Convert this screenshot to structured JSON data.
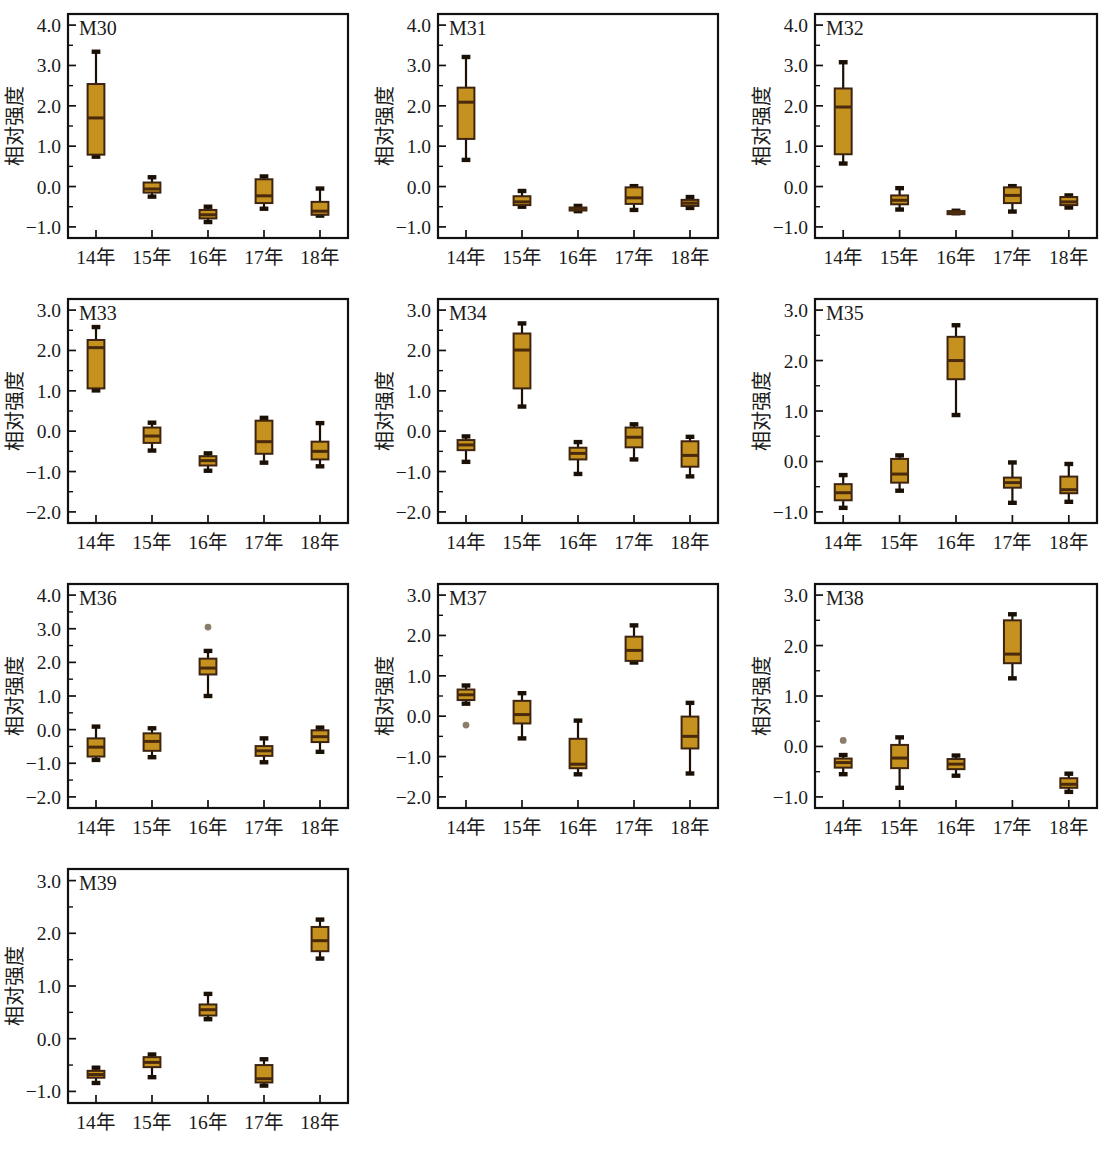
{
  "figure": {
    "kind": "box-plot-panel-grid",
    "panel_count": 10,
    "y_axis_title": "相对强度",
    "category_labels": [
      "14年",
      "15年",
      "16年",
      "17年",
      "18年"
    ],
    "colors": {
      "box_fill": "#C6921F",
      "box_edge": "#3D2410",
      "median_line": "#4A2A0C",
      "whisker": "#1B1005",
      "outlier": "#8A7E6A",
      "frame": "#111111",
      "background": "#FFFFFF",
      "text": "#1A1A1A"
    }
  },
  "chart_data": [
    {
      "type": "box",
      "title": "M30",
      "xlabel": "",
      "ylabel": "相对强度",
      "ylim": [
        -1.0,
        4.0
      ],
      "yticks": [
        -1.0,
        0.0,
        1.0,
        2.0,
        3.0,
        4.0
      ],
      "ytick_labels": [
        "-1.0",
        "0.0",
        "1.0",
        "2.0",
        "3.0",
        "4.0"
      ],
      "grid": false,
      "categories": [
        "14年",
        "15年",
        "16年",
        "17年",
        "18年"
      ],
      "boxes": [
        {
          "category": "14年",
          "min": 0.74,
          "q1": 0.79,
          "median": 1.7,
          "q3": 2.54,
          "max": 3.34,
          "outliers": []
        },
        {
          "category": "15年",
          "min": -0.25,
          "q1": -0.15,
          "median": -0.06,
          "q3": 0.1,
          "max": 0.23,
          "outliers": []
        },
        {
          "category": "16年",
          "min": -0.88,
          "q1": -0.79,
          "median": -0.7,
          "q3": -0.58,
          "max": -0.5,
          "outliers": []
        },
        {
          "category": "17年",
          "min": -0.55,
          "q1": -0.41,
          "median": -0.23,
          "q3": 0.18,
          "max": 0.25,
          "outliers": []
        },
        {
          "category": "18年",
          "min": -0.72,
          "q1": -0.7,
          "median": -0.61,
          "q3": -0.38,
          "max": -0.05,
          "outliers": []
        }
      ]
    },
    {
      "type": "box",
      "title": "M31",
      "xlabel": "",
      "ylabel": "相对强度",
      "ylim": [
        -1.0,
        4.0
      ],
      "yticks": [
        -1.0,
        0.0,
        1.0,
        2.0,
        3.0,
        4.0
      ],
      "ytick_labels": [
        "-1.0",
        "0.0",
        "1.0",
        "2.0",
        "3.0",
        "4.0"
      ],
      "grid": false,
      "categories": [
        "14年",
        "15年",
        "16年",
        "17年",
        "18年"
      ],
      "boxes": [
        {
          "category": "14年",
          "min": 0.66,
          "q1": 1.18,
          "median": 2.09,
          "q3": 2.45,
          "max": 3.21,
          "outliers": []
        },
        {
          "category": "15年",
          "min": -0.5,
          "q1": -0.46,
          "median": -0.38,
          "q3": -0.24,
          "max": -0.11,
          "outliers": []
        },
        {
          "category": "16年",
          "min": -0.61,
          "q1": -0.59,
          "median": -0.56,
          "q3": -0.52,
          "max": -0.48,
          "outliers": []
        },
        {
          "category": "17年",
          "min": -0.58,
          "q1": -0.43,
          "median": -0.28,
          "q3": -0.02,
          "max": 0.01,
          "outliers": []
        },
        {
          "category": "18年",
          "min": -0.53,
          "q1": -0.48,
          "median": -0.41,
          "q3": -0.33,
          "max": -0.26,
          "outliers": []
        }
      ]
    },
    {
      "type": "box",
      "title": "M32",
      "xlabel": "",
      "ylabel": "相对强度",
      "ylim": [
        -1.0,
        4.0
      ],
      "yticks": [
        -1.0,
        0.0,
        1.0,
        2.0,
        3.0,
        4.0
      ],
      "ytick_labels": [
        "-1.0",
        "0.0",
        "1.0",
        "2.0",
        "3.0",
        "4.0"
      ],
      "grid": false,
      "categories": [
        "14年",
        "15年",
        "16年",
        "17年",
        "18年"
      ],
      "boxes": [
        {
          "category": "14年",
          "min": 0.57,
          "q1": 0.8,
          "median": 1.97,
          "q3": 2.43,
          "max": 3.08,
          "outliers": []
        },
        {
          "category": "15年",
          "min": -0.57,
          "q1": -0.44,
          "median": -0.34,
          "q3": -0.22,
          "max": -0.04,
          "outliers": []
        },
        {
          "category": "16年",
          "min": -0.66,
          "q1": -0.65,
          "median": -0.63,
          "q3": -0.61,
          "max": -0.6,
          "outliers": []
        },
        {
          "category": "17年",
          "min": -0.62,
          "q1": -0.41,
          "median": -0.22,
          "q3": -0.02,
          "max": 0.01,
          "outliers": []
        },
        {
          "category": "18年",
          "min": -0.52,
          "q1": -0.46,
          "median": -0.38,
          "q3": -0.26,
          "max": -0.22,
          "outliers": []
        }
      ]
    },
    {
      "type": "box",
      "title": "M33",
      "xlabel": "",
      "ylabel": "相对强度",
      "ylim": [
        -2.0,
        3.0
      ],
      "yticks": [
        -2.0,
        -1.0,
        0.0,
        1.0,
        2.0,
        3.0
      ],
      "ytick_labels": [
        "-2.0",
        "-1.0",
        "0.0",
        "1.0",
        "2.0",
        "3.0"
      ],
      "grid": false,
      "categories": [
        "14年",
        "15年",
        "16年",
        "17年",
        "18年"
      ],
      "boxes": [
        {
          "category": "14年",
          "min": 1.01,
          "q1": 1.06,
          "median": 2.07,
          "q3": 2.26,
          "max": 2.58,
          "outliers": []
        },
        {
          "category": "15年",
          "min": -0.48,
          "q1": -0.29,
          "median": -0.12,
          "q3": 0.09,
          "max": 0.21,
          "outliers": []
        },
        {
          "category": "16年",
          "min": -0.98,
          "q1": -0.85,
          "median": -0.73,
          "q3": -0.62,
          "max": -0.55,
          "outliers": []
        },
        {
          "category": "17年",
          "min": -0.78,
          "q1": -0.56,
          "median": -0.26,
          "q3": 0.26,
          "max": 0.33,
          "outliers": []
        },
        {
          "category": "18年",
          "min": -0.87,
          "q1": -0.7,
          "median": -0.5,
          "q3": -0.26,
          "max": 0.2,
          "outliers": []
        }
      ]
    },
    {
      "type": "box",
      "title": "M34",
      "xlabel": "",
      "ylabel": "相对强度",
      "ylim": [
        -2.0,
        3.0
      ],
      "yticks": [
        -2.0,
        -1.0,
        0.0,
        1.0,
        2.0,
        3.0
      ],
      "ytick_labels": [
        "-2.0",
        "-1.0",
        "0.0",
        "1.0",
        "2.0",
        "3.0"
      ],
      "grid": false,
      "categories": [
        "14年",
        "15年",
        "16年",
        "17年",
        "18年"
      ],
      "boxes": [
        {
          "category": "14年",
          "min": -0.76,
          "q1": -0.47,
          "median": -0.34,
          "q3": -0.22,
          "max": -0.13,
          "outliers": []
        },
        {
          "category": "15年",
          "min": 0.61,
          "q1": 1.06,
          "median": 2.01,
          "q3": 2.42,
          "max": 2.67,
          "outliers": []
        },
        {
          "category": "16年",
          "min": -1.06,
          "q1": -0.7,
          "median": -0.55,
          "q3": -0.41,
          "max": -0.27,
          "outliers": []
        },
        {
          "category": "17年",
          "min": -0.7,
          "q1": -0.4,
          "median": -0.15,
          "q3": 0.09,
          "max": 0.17,
          "outliers": []
        },
        {
          "category": "18年",
          "min": -1.12,
          "q1": -0.88,
          "median": -0.6,
          "q3": -0.25,
          "max": -0.14,
          "outliers": []
        }
      ]
    },
    {
      "type": "box",
      "title": "M35",
      "xlabel": "",
      "ylabel": "相对强度",
      "ylim": [
        -1.0,
        3.0
      ],
      "yticks": [
        -1.0,
        0.0,
        1.0,
        2.0,
        3.0
      ],
      "ytick_labels": [
        "-1.0",
        "0.0",
        "1.0",
        "2.0",
        "3.0"
      ],
      "grid": false,
      "categories": [
        "14年",
        "15年",
        "16年",
        "17年",
        "18年"
      ],
      "boxes": [
        {
          "category": "14年",
          "min": -0.92,
          "q1": -0.77,
          "median": -0.62,
          "q3": -0.45,
          "max": -0.27,
          "outliers": []
        },
        {
          "category": "15年",
          "min": -0.58,
          "q1": -0.42,
          "median": -0.25,
          "q3": 0.05,
          "max": 0.12,
          "outliers": []
        },
        {
          "category": "16年",
          "min": 0.92,
          "q1": 1.63,
          "median": 2.0,
          "q3": 2.47,
          "max": 2.7,
          "outliers": []
        },
        {
          "category": "17年",
          "min": -0.82,
          "q1": -0.52,
          "median": -0.42,
          "q3": -0.32,
          "max": -0.02,
          "outliers": []
        },
        {
          "category": "18年",
          "min": -0.8,
          "q1": -0.63,
          "median": -0.56,
          "q3": -0.3,
          "max": -0.05,
          "outliers": []
        }
      ]
    },
    {
      "type": "box",
      "title": "M36",
      "xlabel": "",
      "ylabel": "相对强度",
      "ylim": [
        -2.0,
        4.0
      ],
      "yticks": [
        -2.0,
        -1.0,
        0.0,
        1.0,
        2.0,
        3.0,
        4.0
      ],
      "ytick_labels": [
        "-2.0",
        "-1.0",
        "0.0",
        "1.0",
        "2.0",
        "3.0",
        "4.0"
      ],
      "grid": false,
      "categories": [
        "14年",
        "15年",
        "16年",
        "17年",
        "18年"
      ],
      "boxes": [
        {
          "category": "14年",
          "min": -0.9,
          "q1": -0.8,
          "median": -0.52,
          "q3": -0.26,
          "max": 0.09,
          "outliers": []
        },
        {
          "category": "15年",
          "min": -0.82,
          "q1": -0.63,
          "median": -0.35,
          "q3": -0.11,
          "max": 0.04,
          "outliers": []
        },
        {
          "category": "16年",
          "min": 1.0,
          "q1": 1.64,
          "median": 1.83,
          "q3": 2.11,
          "max": 2.34,
          "outliers": [
            3.05
          ]
        },
        {
          "category": "17年",
          "min": -0.97,
          "q1": -0.78,
          "median": -0.63,
          "q3": -0.49,
          "max": -0.26,
          "outliers": []
        },
        {
          "category": "18年",
          "min": -0.66,
          "q1": -0.37,
          "median": -0.21,
          "q3": -0.02,
          "max": 0.06,
          "outliers": []
        }
      ]
    },
    {
      "type": "box",
      "title": "M37",
      "xlabel": "",
      "ylabel": "相对强度",
      "ylim": [
        -2.0,
        3.0
      ],
      "yticks": [
        -2.0,
        -1.0,
        0.0,
        1.0,
        2.0,
        3.0
      ],
      "ytick_labels": [
        "-2.0",
        "-1.0",
        "0.0",
        "1.0",
        "2.0",
        "3.0"
      ],
      "grid": false,
      "categories": [
        "14年",
        "15年",
        "16年",
        "17年",
        "18年"
      ],
      "boxes": [
        {
          "category": "14年",
          "min": 0.31,
          "q1": 0.4,
          "median": 0.53,
          "q3": 0.66,
          "max": 0.76,
          "outliers": [
            -0.22
          ]
        },
        {
          "category": "15年",
          "min": -0.55,
          "q1": -0.18,
          "median": 0.04,
          "q3": 0.38,
          "max": 0.57,
          "outliers": []
        },
        {
          "category": "16年",
          "min": -1.44,
          "q1": -1.29,
          "median": -1.19,
          "q3": -0.56,
          "max": -0.11,
          "outliers": []
        },
        {
          "category": "17年",
          "min": 1.33,
          "q1": 1.37,
          "median": 1.63,
          "q3": 1.97,
          "max": 2.25,
          "outliers": []
        },
        {
          "category": "18年",
          "min": -1.42,
          "q1": -0.8,
          "median": -0.5,
          "q3": -0.01,
          "max": 0.33,
          "outliers": []
        }
      ]
    },
    {
      "type": "box",
      "title": "M38",
      "xlabel": "",
      "ylabel": "相对强度",
      "ylim": [
        -1.0,
        3.0
      ],
      "yticks": [
        -1.0,
        0.0,
        1.0,
        2.0,
        3.0
      ],
      "ytick_labels": [
        "-1.0",
        "0.0",
        "1.0",
        "2.0",
        "3.0"
      ],
      "grid": false,
      "categories": [
        "14年",
        "15年",
        "16年",
        "17年",
        "18年"
      ],
      "boxes": [
        {
          "category": "14年",
          "min": -0.55,
          "q1": -0.42,
          "median": -0.32,
          "q3": -0.24,
          "max": -0.17,
          "outliers": [
            0.12
          ]
        },
        {
          "category": "15年",
          "min": -0.82,
          "q1": -0.43,
          "median": -0.23,
          "q3": 0.03,
          "max": 0.18,
          "outliers": []
        },
        {
          "category": "16年",
          "min": -0.58,
          "q1": -0.45,
          "median": -0.35,
          "q3": -0.25,
          "max": -0.18,
          "outliers": []
        },
        {
          "category": "17年",
          "min": 1.35,
          "q1": 1.65,
          "median": 1.83,
          "q3": 2.5,
          "max": 2.62,
          "outliers": []
        },
        {
          "category": "18年",
          "min": -0.9,
          "q1": -0.82,
          "median": -0.75,
          "q3": -0.63,
          "max": -0.54,
          "outliers": []
        }
      ]
    },
    {
      "type": "box",
      "title": "M39",
      "xlabel": "",
      "ylabel": "相对强度",
      "ylim": [
        -1.0,
        3.0
      ],
      "yticks": [
        -1.0,
        0.0,
        1.0,
        2.0,
        3.0
      ],
      "ytick_labels": [
        "-1.0",
        "0.0",
        "1.0",
        "2.0",
        "3.0"
      ],
      "grid": false,
      "categories": [
        "14年",
        "15年",
        "16年",
        "17年",
        "18年"
      ],
      "boxes": [
        {
          "category": "14年",
          "min": -0.84,
          "q1": -0.74,
          "median": -0.68,
          "q3": -0.61,
          "max": -0.55,
          "outliers": []
        },
        {
          "category": "15年",
          "min": -0.73,
          "q1": -0.54,
          "median": -0.45,
          "q3": -0.35,
          "max": -0.3,
          "outliers": []
        },
        {
          "category": "16年",
          "min": 0.37,
          "q1": 0.44,
          "median": 0.55,
          "q3": 0.65,
          "max": 0.85,
          "outliers": []
        },
        {
          "category": "17年",
          "min": -0.89,
          "q1": -0.83,
          "median": -0.76,
          "q3": -0.5,
          "max": -0.39,
          "outliers": []
        },
        {
          "category": "18年",
          "min": 1.52,
          "q1": 1.66,
          "median": 1.86,
          "q3": 2.12,
          "max": 2.26,
          "outliers": []
        }
      ]
    }
  ]
}
